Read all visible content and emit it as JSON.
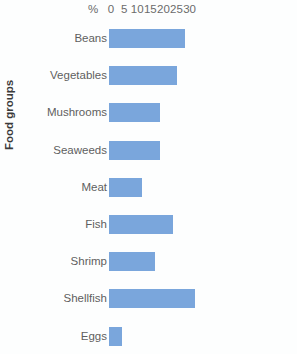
{
  "chart_data": {
    "type": "bar",
    "orientation": "horizontal",
    "title": "",
    "xlabel": "%",
    "ylabel": "Food groups",
    "unit_label": "%",
    "categories": [
      "Beans",
      "Vegetables",
      "Mushrooms",
      "Seaweeds",
      "Meat",
      "Fish",
      "Shrimp",
      "Shellfish",
      "Eggs"
    ],
    "values": [
      29,
      26,
      19.5,
      19.5,
      12.5,
      24.5,
      17.5,
      33,
      5
    ],
    "xticks": [
      0,
      5,
      10,
      15,
      20,
      25,
      30
    ],
    "xtick_labels": [
      "0",
      "5",
      "10",
      "15",
      "20",
      "25",
      "30"
    ],
    "xlim": [
      0,
      30
    ],
    "grid": false,
    "legend": null,
    "bar_color": "#7aa6dc",
    "background_color": "#fdfefe",
    "series": [
      {
        "name": "Percentage",
        "values": [
          29,
          26,
          19.5,
          19.5,
          12.5,
          24.5,
          17.5,
          33,
          5
        ]
      }
    ]
  },
  "axis": {
    "unit": "%",
    "ticks": [
      {
        "label": "0",
        "value": 0
      },
      {
        "label": "5",
        "value": 5
      },
      {
        "label": "10",
        "value": 10
      },
      {
        "label": "15",
        "value": 15
      },
      {
        "label": "20",
        "value": 20
      },
      {
        "label": "25",
        "value": 25
      },
      {
        "label": "30",
        "value": 30
      }
    ],
    "y_title": "Food groups"
  },
  "rows": [
    {
      "label": "Beans",
      "value": 29
    },
    {
      "label": "Vegetables",
      "value": 26
    },
    {
      "label": "Mushrooms",
      "value": 19.5
    },
    {
      "label": "Seaweeds",
      "value": 19.5
    },
    {
      "label": "Meat",
      "value": 12.5
    },
    {
      "label": "Fish",
      "value": 24.5
    },
    {
      "label": "Shrimp",
      "value": 17.5
    },
    {
      "label": "Shellfish",
      "value": 33
    },
    {
      "label": "Eggs",
      "value": 5
    }
  ]
}
